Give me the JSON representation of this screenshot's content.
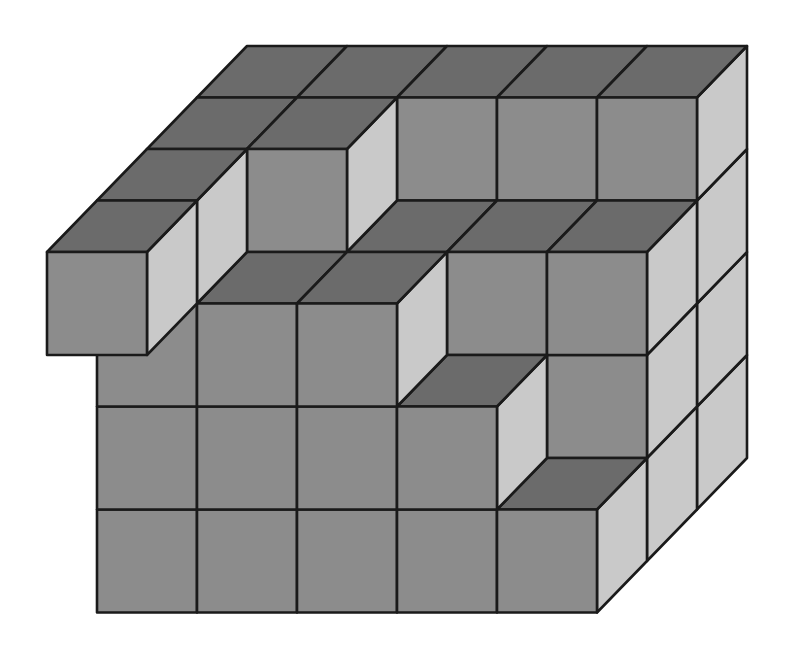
{
  "figure": {
    "grid": {
      "columns": 5,
      "depth_rows": 4,
      "max_height": 4
    }
  },
  "projection": {
    "origin_x": 47,
    "origin_y": 664,
    "cell_width": 100,
    "cell_height": 103,
    "depth_dx": 50,
    "depth_dy": -51.5
  },
  "colors": {
    "top": "#6b6b6b",
    "front": "#8c8c8c",
    "side": "#c9c9c9",
    "outline": "#1a1a1a",
    "background": "#ffffff"
  },
  "height_map": {
    "note": "rows indexed front (k=0) to back (k=3); columns i=0..4 left to right",
    "k1": [
      4,
      3,
      3,
      2,
      1
    ],
    "k2": [
      4,
      4,
      3,
      3,
      3
    ],
    "k3": [
      4,
      4,
      4,
      4,
      4
    ]
  },
  "floating_voxels": [
    {
      "i": 0,
      "j": 3,
      "k": 0
    }
  ]
}
